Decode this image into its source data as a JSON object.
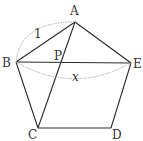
{
  "diagram": {
    "type": "geometry",
    "points": {
      "A": {
        "label": "A",
        "x": 75,
        "y": 22
      },
      "B": {
        "label": "B",
        "x": 16,
        "y": 62
      },
      "C": {
        "label": "C",
        "x": 38,
        "y": 128
      },
      "D": {
        "label": "D",
        "x": 111,
        "y": 128
      },
      "E": {
        "label": "E",
        "x": 131,
        "y": 63
      },
      "P": {
        "label": "P",
        "x": 59,
        "y": 62
      }
    },
    "segments": [
      "AB",
      "BC",
      "CD",
      "DE",
      "EA",
      "AC",
      "BE"
    ],
    "annotations": {
      "side_length": "1",
      "diagonal_length": "x"
    },
    "colors": {
      "line": "#2b2b2b",
      "arc": "#b0b0b0",
      "text": "#333333"
    }
  }
}
